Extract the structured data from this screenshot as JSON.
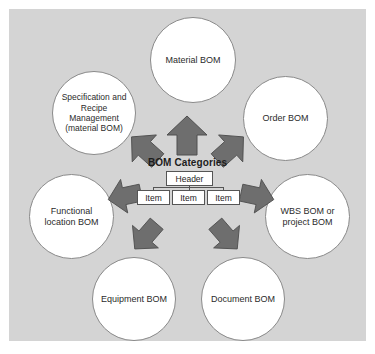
{
  "diagram": {
    "center_title": "BOM Categories",
    "tree": {
      "header_label": "Header",
      "items": [
        {
          "label": "Item"
        },
        {
          "label": "Item"
        },
        {
          "label": "Item"
        }
      ]
    },
    "nodes": [
      {
        "id": "material",
        "label": "Material BOM",
        "position": "top"
      },
      {
        "id": "specification",
        "label": "Specification and Recipe Management (material BOM)",
        "position": "top-left"
      },
      {
        "id": "order",
        "label": "Order BOM",
        "position": "top-right"
      },
      {
        "id": "functional-location",
        "label": "Functional location BOM",
        "position": "left"
      },
      {
        "id": "wbs",
        "label": "WBS BOM or project BOM",
        "position": "right"
      },
      {
        "id": "equipment",
        "label": "Equipment BOM",
        "position": "bottom-left"
      },
      {
        "id": "document",
        "label": "Document BOM",
        "position": "bottom-right"
      }
    ],
    "arrows": [
      {
        "id": "arrow-up",
        "direction": "up",
        "target": "material"
      },
      {
        "id": "arrow-up-left",
        "direction": "up-left",
        "target": "specification"
      },
      {
        "id": "arrow-up-right",
        "direction": "up-right",
        "target": "order"
      },
      {
        "id": "arrow-left",
        "direction": "left",
        "target": "functional-location"
      },
      {
        "id": "arrow-right",
        "direction": "right",
        "target": "wbs"
      },
      {
        "id": "arrow-down-left",
        "direction": "down-left",
        "target": "equipment"
      },
      {
        "id": "arrow-down-right",
        "direction": "down-right",
        "target": "document"
      }
    ],
    "colors": {
      "panel_background": "#d4d4d4",
      "page_background": "#ffffff",
      "circle_fill": "#ffffff",
      "circle_border": "#8a8a8a",
      "arrow_fill": "#6e6e6e",
      "arrow_border": "#4a4a4a",
      "text": "#2b2b2b"
    }
  }
}
